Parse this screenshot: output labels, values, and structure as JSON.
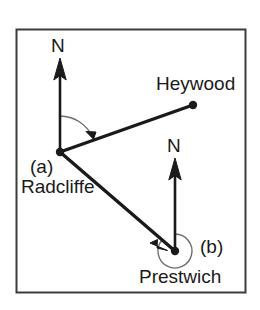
{
  "figure": {
    "type": "bearings-diagram",
    "background_color": "#ffffff",
    "stroke_color": "#1a1a1a",
    "frame_color": "#3c3c3c",
    "arc_color": "#6e6e6e",
    "frame": {
      "x": 16,
      "y": 29,
      "width": 230,
      "height": 264
    }
  },
  "labels": {
    "north_radcliffe": "N",
    "north_prestwich": "N",
    "heywood": "Heywood",
    "radcliffe": "Radcliffe",
    "prestwich": "Prestwich",
    "angle_a": "(a)",
    "angle_b": "(b)"
  },
  "points": [
    {
      "name": "Radcliffe",
      "x": 60,
      "y": 152,
      "marker": "dot"
    },
    {
      "name": "Heywood",
      "x": 193,
      "y": 105,
      "marker": "dot"
    },
    {
      "name": "Prestwich",
      "x": 175,
      "y": 251,
      "marker": "dot"
    }
  ],
  "north_arrows": [
    {
      "at": "Radcliffe",
      "x": 60,
      "y_base": 152,
      "y_tip": 60,
      "label": "N"
    },
    {
      "at": "Prestwich",
      "x": 175,
      "y_base": 251,
      "y_tip": 160,
      "label": "N"
    }
  ],
  "segments": [
    {
      "from": "Radcliffe",
      "to": "Heywood",
      "arrowhead": "mid",
      "label": ""
    },
    {
      "from": "Radcliffe",
      "to": "Prestwich",
      "arrowhead": "mid",
      "label": ""
    }
  ],
  "angles": [
    {
      "id": "a",
      "label": "(a)",
      "vertex": "Radcliffe",
      "from_ray": "north",
      "to_ray": "Heywood",
      "direction": "clockwise",
      "reflex": false,
      "radius": 36
    },
    {
      "id": "b",
      "label": "(b)",
      "vertex": "Prestwich",
      "from_ray": "north",
      "to_ray": "Radcliffe",
      "direction": "clockwise",
      "reflex": true,
      "radius": 17
    }
  ],
  "label_positions": {
    "north_radcliffe": {
      "left": 51,
      "top": 36
    },
    "north_prestwich": {
      "left": 167,
      "top": 136
    },
    "heywood": {
      "left": 156,
      "top": 74
    },
    "radcliffe": {
      "left": 21,
      "top": 177
    },
    "angle_a": {
      "left": 30,
      "top": 157
    },
    "angle_b": {
      "left": 200,
      "top": 237
    },
    "prestwich": {
      "left": 139,
      "top": 267
    }
  }
}
